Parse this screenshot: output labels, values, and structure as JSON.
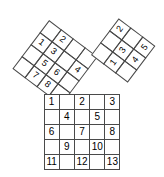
{
  "figure": {
    "line_color": "#4a4a4a",
    "text_color": "#000000",
    "background": "#ffffff"
  },
  "squares": {
    "leg_a": {
      "name": "left-tilted-square",
      "rows": 4,
      "cols": 4,
      "rotation_deg": 37,
      "cells": [
        "",
        "2",
        "",
        "",
        "1",
        "3",
        "",
        "4",
        "",
        "5",
        "6",
        "",
        "",
        "7",
        "8",
        ""
      ]
    },
    "leg_b": {
      "name": "right-tilted-square",
      "rows": 3,
      "cols": 3,
      "rotation_deg": -53,
      "cells": [
        "",
        "",
        "2",
        "1",
        "3",
        "",
        "",
        "4",
        "5"
      ]
    },
    "hypotenuse": {
      "name": "bottom-upright-square",
      "rows": 5,
      "cols": 5,
      "rotation_deg": 0,
      "cells": [
        "1",
        "",
        "2",
        "",
        "3",
        "",
        "4",
        "",
        "5",
        "",
        "6",
        "",
        "7",
        "",
        "8",
        "",
        "9",
        "",
        "10",
        "",
        "11",
        "",
        "12",
        "",
        "13"
      ]
    }
  }
}
